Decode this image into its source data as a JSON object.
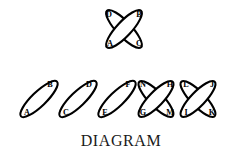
{
  "figure": {
    "caption": "DIAGRAM",
    "background_color": "#ffffff",
    "stroke_color": "#000000",
    "fill_color": "#ffffff",
    "groups": [
      {
        "name": "top-crossed-pair",
        "kind": "crossed-X",
        "labels": [
          "D",
          "B",
          "A",
          "C"
        ],
        "links": [
          {
            "label_start": "A",
            "label_end": "B",
            "orientation": "bottom-left-to-top-right"
          },
          {
            "label_start": "C",
            "label_end": "D",
            "orientation": "bottom-right-to-top-left"
          }
        ]
      },
      {
        "name": "link-ab",
        "kind": "single",
        "labels": [
          "B",
          "A"
        ],
        "links": [
          {
            "label_start": "A",
            "label_end": "B",
            "orientation": "bottom-left-to-top-right"
          }
        ]
      },
      {
        "name": "link-cd",
        "kind": "single",
        "labels": [
          "D",
          "C"
        ],
        "links": [
          {
            "label_start": "C",
            "label_end": "D",
            "orientation": "bottom-left-to-top-right"
          }
        ]
      },
      {
        "name": "link-ef",
        "kind": "single",
        "labels": [
          "F",
          "E"
        ],
        "links": [
          {
            "label_start": "E",
            "label_end": "F",
            "orientation": "bottom-left-to-top-right"
          }
        ]
      },
      {
        "name": "crossed-pair-ghmn",
        "kind": "crossed-X",
        "labels": [
          "N",
          "H",
          "G",
          "M"
        ],
        "links": [
          {
            "label_start": "G",
            "label_end": "H",
            "orientation": "bottom-left-to-top-right"
          },
          {
            "label_start": "M",
            "label_end": "N",
            "orientation": "bottom-right-to-top-left"
          }
        ]
      },
      {
        "name": "crossed-pair-ijkl",
        "kind": "crossed-X",
        "labels": [
          "L",
          "J",
          "I",
          "K"
        ],
        "links": [
          {
            "label_start": "I",
            "label_end": "J",
            "orientation": "bottom-left-to-top-right"
          },
          {
            "label_start": "K",
            "label_end": "L",
            "orientation": "bottom-right-to-top-left"
          }
        ]
      }
    ],
    "labels": {
      "top_D": "D",
      "top_B": "B",
      "top_A": "A",
      "top_C": "C",
      "row_A": "A",
      "row_B": "B",
      "row_C": "C",
      "row_D": "D",
      "row_E": "E",
      "row_F": "F",
      "row_N": "N",
      "row_H": "H",
      "row_G": "G",
      "row_M": "M",
      "row_L": "L",
      "row_J": "J",
      "row_I": "I",
      "row_K": "K"
    }
  }
}
